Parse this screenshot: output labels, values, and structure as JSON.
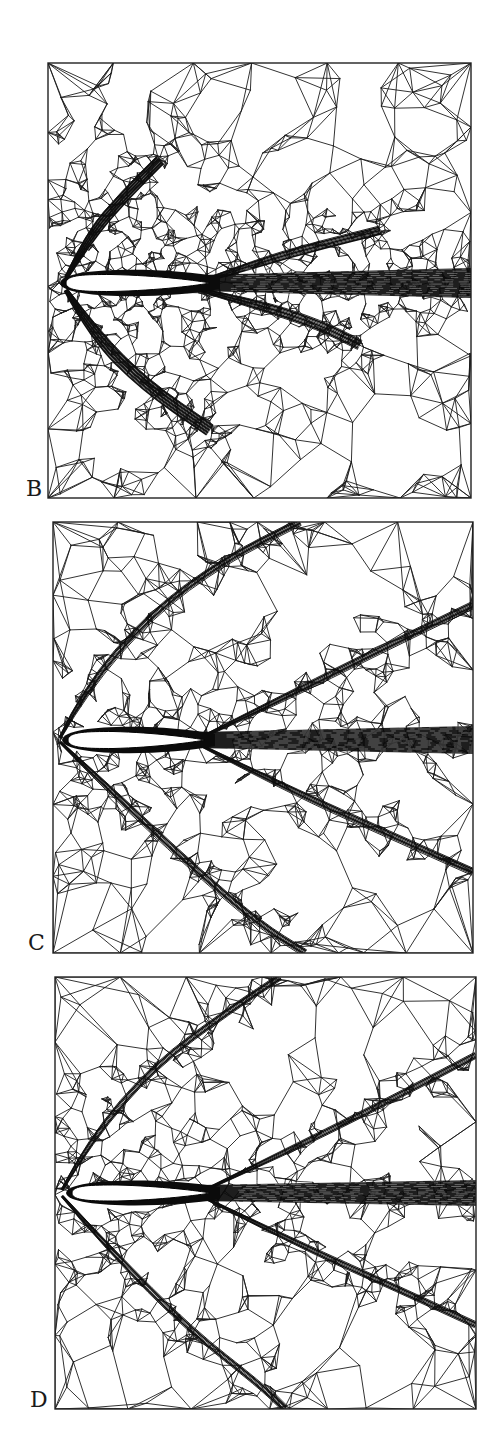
{
  "figure": {
    "panels": [
      {
        "id": "B",
        "label": "B",
        "rect": {
          "x": 48,
          "y": 63,
          "w": 423,
          "h": 435
        },
        "label_pos": {
          "x": 26,
          "y": 478
        },
        "airfoil": {
          "x1": 66,
          "x2": 210,
          "cy": 283,
          "thickness": 17
        },
        "wake": {
          "x1": 200,
          "x2": 471,
          "cy": 283,
          "h0": 16,
          "h1": 30
        },
        "shocks": [
          {
            "name": "upper-bow-shock",
            "points": [
              [
                66,
                278
              ],
              [
                90,
                235
              ],
              [
                125,
                195
              ],
              [
                160,
                160
              ]
            ],
            "width": 10,
            "lines": 14
          },
          {
            "name": "lower-bow-shock",
            "points": [
              [
                66,
                290
              ],
              [
                95,
                335
              ],
              [
                145,
                385
              ],
              [
                210,
                430
              ]
            ],
            "width": 12,
            "lines": 14
          },
          {
            "name": "upper-expansion-fan",
            "points": [
              [
                200,
                282
              ],
              [
                260,
                262
              ],
              [
                320,
                245
              ],
              [
                380,
                230
              ]
            ],
            "width": 8,
            "lines": 8
          },
          {
            "name": "lower-expansion-fan",
            "points": [
              [
                200,
                290
              ],
              [
                260,
                305
              ],
              [
                320,
                325
              ],
              [
                360,
                345
              ]
            ],
            "width": 10,
            "lines": 9
          }
        ],
        "mesh_seed": 11,
        "mesh_density": 1.6
      },
      {
        "id": "C",
        "label": "C",
        "rect": {
          "x": 53,
          "y": 522,
          "w": 420,
          "h": 431
        },
        "label_pos": {
          "x": 28,
          "y": 932
        },
        "airfoil": {
          "x1": 68,
          "x2": 205,
          "cy": 740,
          "thickness": 17
        },
        "wake": {
          "x1": 195,
          "x2": 473,
          "cy": 740,
          "h0": 16,
          "h1": 28
        },
        "shocks": [
          {
            "name": "upper-bow-shock",
            "points": [
              [
                60,
                738
              ],
              [
                85,
                690
              ],
              [
                150,
                615
              ],
              [
                225,
                560
              ],
              [
                300,
                522
              ]
            ],
            "width": 7,
            "lines": 7
          },
          {
            "name": "lower-bow-shock",
            "points": [
              [
                60,
                742
              ],
              [
                110,
                790
              ],
              [
                190,
                865
              ],
              [
                260,
                925
              ],
              [
                305,
                953
              ]
            ],
            "width": 7,
            "lines": 7
          },
          {
            "name": "upper-trailing-shock",
            "points": [
              [
                200,
                738
              ],
              [
                280,
                700
              ],
              [
                380,
                650
              ],
              [
                473,
                605
              ]
            ],
            "width": 7,
            "lines": 7
          },
          {
            "name": "lower-trailing-shock",
            "points": [
              [
                200,
                745
              ],
              [
                290,
                790
              ],
              [
                390,
                835
              ],
              [
                473,
                872
              ]
            ],
            "width": 7,
            "lines": 7
          }
        ],
        "mesh_seed": 23,
        "mesh_density": 1.0
      },
      {
        "id": "D",
        "label": "D",
        "rect": {
          "x": 55,
          "y": 977,
          "w": 421,
          "h": 432
        },
        "label_pos": {
          "x": 30,
          "y": 1389
        },
        "airfoil": {
          "x1": 72,
          "x2": 210,
          "cy": 1193,
          "thickness": 16
        },
        "wake": {
          "x1": 200,
          "x2": 476,
          "cy": 1193,
          "h0": 16,
          "h1": 26
        },
        "shocks": [
          {
            "name": "upper-bow-shock",
            "points": [
              [
                62,
                1190
              ],
              [
                90,
                1140
              ],
              [
                155,
                1065
              ],
              [
                230,
                1010
              ],
              [
                280,
                977
              ]
            ],
            "width": 6,
            "lines": 6
          },
          {
            "name": "lower-bow-shock",
            "points": [
              [
                62,
                1196
              ],
              [
                110,
                1250
              ],
              [
                190,
                1330
              ],
              [
                260,
                1385
              ],
              [
                285,
                1409
              ]
            ],
            "width": 6,
            "lines": 6
          },
          {
            "name": "upper-trailing-shock",
            "points": [
              [
                205,
                1190
              ],
              [
                290,
                1150
              ],
              [
                390,
                1100
              ],
              [
                476,
                1055
              ]
            ],
            "width": 6,
            "lines": 6
          },
          {
            "name": "lower-trailing-shock",
            "points": [
              [
                205,
                1198
              ],
              [
                300,
                1245
              ],
              [
                400,
                1290
              ],
              [
                476,
                1325
              ]
            ],
            "width": 6,
            "lines": 6
          }
        ],
        "mesh_seed": 37,
        "mesh_density": 1.0
      }
    ]
  }
}
